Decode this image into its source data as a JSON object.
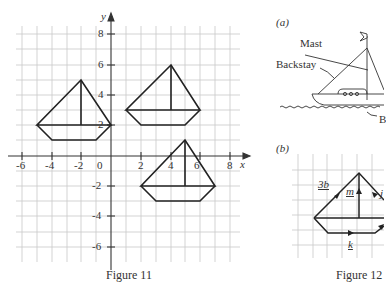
{
  "figure11": {
    "caption": "Figure 11",
    "x_axis_label": "x",
    "y_axis_label": "y",
    "x_ticks": [
      "-6",
      "-4",
      "-2",
      "0",
      "2",
      "4",
      "6",
      "8"
    ],
    "y_ticks": [
      "8",
      "6",
      "4",
      "2",
      "-2",
      "-4",
      "-6"
    ],
    "boats": [
      {
        "name": "boat-A",
        "top": [
          -2,
          5
        ],
        "deck_left": [
          -5,
          2
        ],
        "deck_right": [
          0,
          2
        ],
        "hull": [
          [
            -4,
            1
          ],
          [
            -1,
            1
          ]
        ],
        "mast_base": [
          -2,
          2
        ]
      },
      {
        "name": "boat-B",
        "top": [
          4,
          6
        ],
        "deck_left": [
          1,
          3
        ],
        "deck_right": [
          6,
          3
        ],
        "hull": [
          [
            2,
            2
          ],
          [
            5,
            2
          ]
        ],
        "mast_base": [
          4,
          3
        ]
      },
      {
        "name": "boat-C",
        "top": [
          5,
          1
        ],
        "deck_left": [
          2,
          -2
        ],
        "deck_right": [
          7,
          -2
        ],
        "hull": [
          [
            3,
            -3
          ],
          [
            6,
            -3
          ]
        ],
        "mast_base": [
          5,
          -2
        ]
      }
    ]
  },
  "figure12": {
    "caption": "Figure 12",
    "part_a": {
      "label": "(a)",
      "annotations": [
        "Mast",
        "Backstay",
        "B"
      ]
    },
    "part_b": {
      "label": "(b)",
      "vectors": [
        "3b",
        "m",
        "j",
        "k"
      ]
    }
  }
}
